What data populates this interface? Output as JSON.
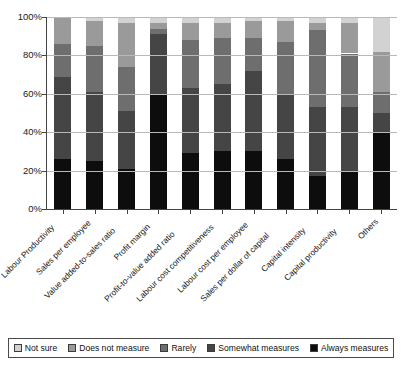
{
  "chart_data": {
    "type": "bar",
    "subtype": "stacked-bar-100-percent",
    "title": "",
    "xlabel": "",
    "ylabel": "",
    "ylim": [
      0,
      100
    ],
    "ytick_labels": [
      "0%",
      "20%",
      "40%",
      "60%",
      "80%",
      "100%"
    ],
    "ytick_values": [
      0,
      20,
      40,
      60,
      80,
      100
    ],
    "grid": true,
    "legend_position": "bottom",
    "stack_order_bottom_to_top": [
      "Always measures",
      "Somewhat measures",
      "Rarely",
      "Does not measure",
      "Not sure"
    ],
    "categories": [
      "Labour Productivity",
      "Sales per employee",
      "Value added-to-sales ratio",
      "Profit margin",
      "Profit-to-value added ratio",
      "Labour cost competitiveness",
      "Labour cost per employee",
      "Sales per dollar of capital",
      "Capital intensity",
      "Capital productivity",
      "Others"
    ],
    "series": [
      {
        "name": "Always measures",
        "color": "#0d0d0d",
        "values": [
          26,
          25,
          21,
          60,
          29,
          30,
          30,
          26,
          17,
          20,
          40
        ]
      },
      {
        "name": "Somewhat measures",
        "color": "#454545",
        "values": [
          43,
          36,
          30,
          31,
          34,
          35,
          42,
          34,
          36,
          33,
          10
        ]
      },
      {
        "name": "Rarely",
        "color": "#6e6e6e",
        "values": [
          17,
          24,
          23,
          3,
          25,
          24,
          17,
          27,
          40,
          28,
          11
        ]
      },
      {
        "name": "Does not measure",
        "color": "#9a9a9a",
        "values": [
          14,
          13,
          23,
          3,
          9,
          8,
          9,
          11,
          4,
          16,
          21
        ]
      },
      {
        "name": "Not sure",
        "color": "#d2d2d2",
        "values": [
          0,
          2,
          3,
          3,
          3,
          3,
          2,
          2,
          3,
          3,
          18
        ]
      }
    ]
  },
  "legend": {
    "items": [
      {
        "label": "Not sure",
        "color": "#d2d2d2"
      },
      {
        "label": "Does not measure",
        "color": "#9a9a9a"
      },
      {
        "label": "Rarely",
        "color": "#6e6e6e"
      },
      {
        "label": "Somewhat measures",
        "color": "#454545"
      },
      {
        "label": "Always measures",
        "color": "#0d0d0d"
      }
    ]
  }
}
